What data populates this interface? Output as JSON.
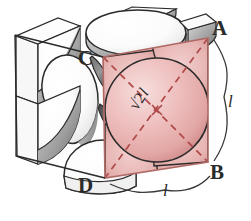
{
  "figure": {
    "name": "fcc-unit-cell-diagram",
    "background_color": "#ffffff"
  },
  "labels": {
    "vertex_a": "A",
    "vertex_b": "B",
    "vertex_c": "C",
    "vertex_d": "D"
  },
  "measures": {
    "edge_right": "l",
    "edge_bottom": "l",
    "face_diagonal_radical": "√2",
    "face_diagonal_unit": "l"
  },
  "colors": {
    "face_tint": "#edbfbd",
    "face_tint_deep": "#e0a6a4",
    "sphere_pink": "#eebcbb",
    "sphere_pink_dark": "#d89b99",
    "sphere_white": "#fefefe",
    "sphere_grey": "#8c8c8c",
    "sphere_grey_dark": "#4f4f4f",
    "outline": "#2b2b2b",
    "dashed_diagonal": "#b04a4a",
    "label_text": "#2b2b2b"
  },
  "geometry": {
    "front_face": {
      "top_left": [
        103,
        57
      ],
      "top_right": [
        208,
        38
      ],
      "bottom_right": [
        208,
        162
      ],
      "bottom_left": [
        105,
        178
      ]
    },
    "cube_depth_offset": [
      -88,
      -22
    ],
    "center_sphere_radius": 52,
    "corner_sphere_radius": 36
  }
}
